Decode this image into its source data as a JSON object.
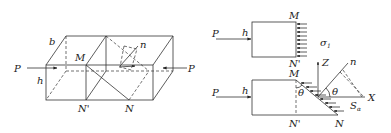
{
  "figure_left": {
    "labels": {
      "b": "b",
      "h": "h",
      "M": "M",
      "N_prime": "N'",
      "N": "N",
      "n": "n",
      "P_left": "P",
      "P_right": "P"
    }
  },
  "figure_top_right": {
    "labels": {
      "P": "P",
      "h": "h",
      "M": "M",
      "N_prime": "N'",
      "sigma": "σ",
      "sigma_sub": "1"
    }
  },
  "figure_bottom_right": {
    "labels": {
      "P": "P",
      "h": "h",
      "M": "M",
      "N_prime": "N'",
      "N": "N",
      "theta_left": "θ",
      "theta_right": "θ",
      "Z": "Z",
      "X": "X",
      "n": "n",
      "S": "S",
      "S_sub": "α"
    }
  },
  "colors": {
    "line": "#333333",
    "text": "#222222",
    "background": "#ffffff"
  }
}
